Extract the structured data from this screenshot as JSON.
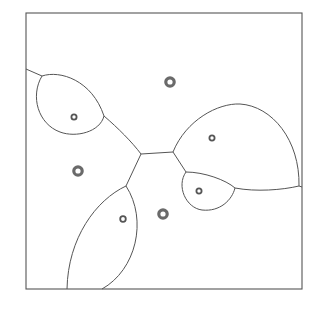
{
  "diagram": {
    "type": "weighted-voronoi (apollonius-style) diagram",
    "colors": {
      "edge": "#555555",
      "site_large": "#6a6a6a",
      "site_small": "#555555",
      "background": "#ffffff"
    },
    "sites": [
      {
        "id": "s1",
        "kind": "large"
      },
      {
        "id": "s2",
        "kind": "large"
      },
      {
        "id": "s3",
        "kind": "large"
      },
      {
        "id": "s4",
        "kind": "small"
      },
      {
        "id": "s5",
        "kind": "small"
      },
      {
        "id": "s6",
        "kind": "small"
      },
      {
        "id": "s7",
        "kind": "small"
      }
    ],
    "cells": 7
  }
}
